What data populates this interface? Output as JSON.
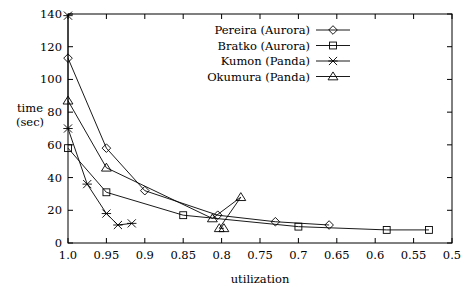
{
  "chart_data": {
    "type": "scatter",
    "title": "",
    "xlabel": "utilization",
    "ylabel": "time (sec)",
    "ylabel_line1": "time",
    "ylabel_line2": "(sec)",
    "xlim": [
      1.0,
      0.5
    ],
    "ylim": [
      0,
      140
    ],
    "x_reversed": true,
    "grid": false,
    "legend_position": "top-right",
    "xticks": [
      1.0,
      0.95,
      0.9,
      0.85,
      0.8,
      0.75,
      0.7,
      0.65,
      0.6,
      0.55,
      0.5
    ],
    "xticklabels": [
      "1.0",
      "0.95",
      "0.9",
      "0.85",
      "0.8",
      "0.75",
      "0.7",
      "0.65",
      "0.6",
      "0.55",
      "0.5"
    ],
    "yticks": [
      0,
      20,
      40,
      60,
      80,
      100,
      120,
      140
    ],
    "yticklabels": [
      "0",
      "20",
      "40",
      "60",
      "80",
      "100",
      "120",
      "140"
    ],
    "series": [
      {
        "name": "Pereira (Aurora)",
        "marker": "diamond",
        "points": [
          {
            "x": 1.0,
            "y": 113
          },
          {
            "x": 0.95,
            "y": 58
          },
          {
            "x": 0.9,
            "y": 32
          },
          {
            "x": 0.805,
            "y": 17
          },
          {
            "x": 0.73,
            "y": 13
          },
          {
            "x": 0.66,
            "y": 11
          }
        ]
      },
      {
        "name": "Bratko (Aurora)",
        "marker": "square",
        "points": [
          {
            "x": 1.0,
            "y": 58
          },
          {
            "x": 0.95,
            "y": 31
          },
          {
            "x": 0.85,
            "y": 17
          },
          {
            "x": 0.7,
            "y": 10
          },
          {
            "x": 0.585,
            "y": 8
          },
          {
            "x": 0.53,
            "y": 8
          }
        ]
      },
      {
        "name": "Kumon (Panda)",
        "marker": "asterisk",
        "points": [
          {
            "x": 1.0,
            "y": 139
          },
          {
            "x": 1.0,
            "y": 70
          },
          {
            "x": 0.975,
            "y": 36
          },
          {
            "x": 0.95,
            "y": 18
          },
          {
            "x": 0.935,
            "y": 11
          },
          {
            "x": 0.917,
            "y": 12
          }
        ]
      },
      {
        "name": "Okumura (Panda)",
        "marker": "triangle",
        "points": [
          {
            "x": 1.0,
            "y": 87
          },
          {
            "x": 0.95,
            "y": 46
          },
          {
            "x": 0.812,
            "y": 15
          },
          {
            "x": 0.775,
            "y": 28
          },
          {
            "x": 0.803,
            "y": 9
          },
          {
            "x": 0.797,
            "y": 9
          }
        ]
      }
    ],
    "legend_entries": [
      {
        "label": "Pereira (Aurora)",
        "marker": "diamond"
      },
      {
        "label": "Bratko (Aurora)",
        "marker": "square"
      },
      {
        "label": "Kumon (Panda)",
        "marker": "asterisk"
      },
      {
        "label": "Okumura (Panda)",
        "marker": "triangle"
      }
    ]
  }
}
